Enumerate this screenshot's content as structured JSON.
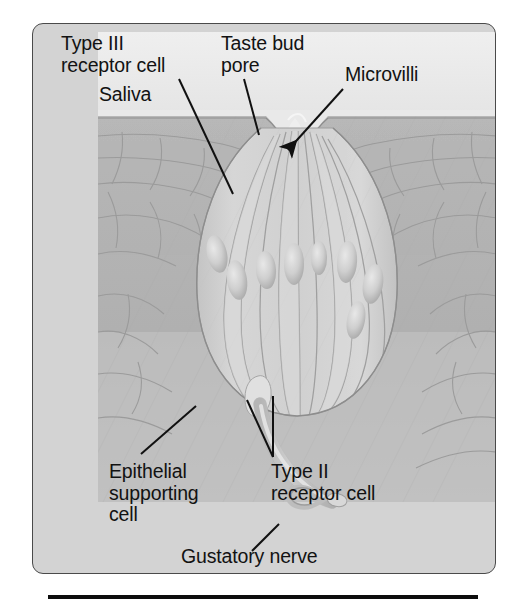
{
  "figure": {
    "type": "anatomical-diagram",
    "subject": "Taste bud",
    "frame": {
      "background_color": "#d3d3d3",
      "border_color": "#4a4a4a"
    },
    "illustration": {
      "saliva_layer_color": "#ebebeb",
      "epithelium_color": "#b4b4b4",
      "taste_bud_color": "#cdcdcd",
      "nerve_color": "#dcdcdc",
      "outline_color": "#8e8e8e"
    },
    "rule_color": "#0d0d0d"
  },
  "labels": {
    "type_iii_receptor_cell": "Type III\nreceptor cell",
    "taste_bud_pore": "Taste bud\npore",
    "microvilli": "Microvilli",
    "saliva": "Saliva",
    "epithelial_supporting_cell": "Epithelial\nsupporting\ncell",
    "type_ii_receptor_cell": "Type II\nreceptor cell",
    "gustatory_nerve": "Gustatory nerve"
  },
  "structures": [
    {
      "name": "Type III receptor cell",
      "pointer": "line"
    },
    {
      "name": "Taste bud pore",
      "pointer": "line"
    },
    {
      "name": "Microvilli",
      "pointer": "arrow"
    },
    {
      "name": "Saliva",
      "pointer": "none"
    },
    {
      "name": "Epithelial supporting cell",
      "pointer": "line"
    },
    {
      "name": "Type II receptor cell",
      "pointer": "double-line"
    },
    {
      "name": "Gustatory nerve",
      "pointer": "line"
    }
  ]
}
